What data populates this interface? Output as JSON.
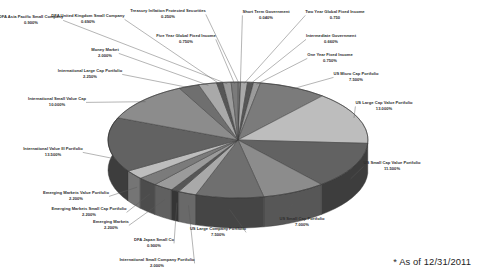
{
  "footnote": "* As of 12/31/2011",
  "chart_data": {
    "type": "pie",
    "title": "",
    "subtitle": "",
    "xlabel": "",
    "ylabel": "",
    "legend_position": "none",
    "grid": false,
    "three_d": true,
    "value_suffix": "%",
    "palette": [
      "#8c8c8c",
      "#6f6f6f",
      "#a9a9a9",
      "#565656",
      "#9b9b9b",
      "#7b7b7b",
      "#bdbdbd",
      "#626262"
    ],
    "categories": [
      "Treasury Inflation Protected Securities",
      "Short Term Government",
      "Two Year Global Fixed Income",
      "Intermediate Government",
      "One Year Fixed Income",
      "US Micro Cap Portfolio",
      "US Large Cap Value Portfolio",
      "US Small Cap Value Portfolio",
      "US Small Cap Portfolio",
      "US Large Company Portfolio",
      "International Small Company Portfolio",
      "DFA Japan Small Co",
      "Emerging Markets",
      "Emerging Markets Small Cap Portfolio",
      "Emerging Markets Value Portfolio",
      "International Value III Portfolio",
      "International Small Value Cap",
      "International Large Cap Portfolio",
      "Money Market",
      "DFA United Kingdom Small Company",
      "DFA Asia Pacific Small Company",
      "Five Year Global Fixed Income"
    ],
    "values": [
      0.25,
      0.04,
      0.75,
      0.66,
      0.75,
      7.5,
      13.0,
      11.5,
      7.0,
      7.5,
      2.0,
      0.9,
      2.2,
      2.2,
      2.2,
      13.5,
      10.0,
      2.25,
      2.0,
      0.69,
      0.9,
      0.75
    ],
    "labels": [
      {
        "name": "Treasury Inflation Protected Securities",
        "pct": "0.250%"
      },
      {
        "name": "Short Term Government",
        "pct": "0.040%"
      },
      {
        "name": "Two Year Global Fixed Income",
        "pct": "0.750"
      },
      {
        "name": "Intermediate Government",
        "pct": "0.660%"
      },
      {
        "name": "One Year Fixed Income",
        "pct": "0.750%"
      },
      {
        "name": "US Micro Cap Portfolio",
        "pct": "7.500%"
      },
      {
        "name": "US Large Cap Value Portfolio",
        "pct": "13.000%"
      },
      {
        "name": "US Small Cap Value Portfolio",
        "pct": "11.500%"
      },
      {
        "name": "US Small Cap Portfolio",
        "pct": "7.000%"
      },
      {
        "name": "US Large Company Portfolio",
        "pct": "7.500%"
      },
      {
        "name": "International Small Company Portfolio",
        "pct": "2.000%"
      },
      {
        "name": "DFA Japan Small Co",
        "pct": "0.900%"
      },
      {
        "name": "Emerging Markets",
        "pct": "2.200%"
      },
      {
        "name": "Emerging Markets Small Cap Portfolio",
        "pct": "2.200%"
      },
      {
        "name": "Emerging Markets Value Portfolio",
        "pct": "2.200%"
      },
      {
        "name": "International Value III Portfolio",
        "pct": "13.500%"
      },
      {
        "name": "International Small Value Cap",
        "pct": "10.000%"
      },
      {
        "name": "International Large Cap Portfolio",
        "pct": "2.250%"
      },
      {
        "name": "Money Market",
        "pct": "2.000%"
      },
      {
        "name": "DFA United Kingdom Small Company",
        "pct": "0.690%"
      },
      {
        "name": "DFA Asia Pacific Small Company",
        "pct": "0.900%"
      },
      {
        "name": "Five Year Global Fixed Income",
        "pct": "0.750%"
      }
    ]
  },
  "annotations": {
    "asof": "* As of 12/31/2011"
  }
}
